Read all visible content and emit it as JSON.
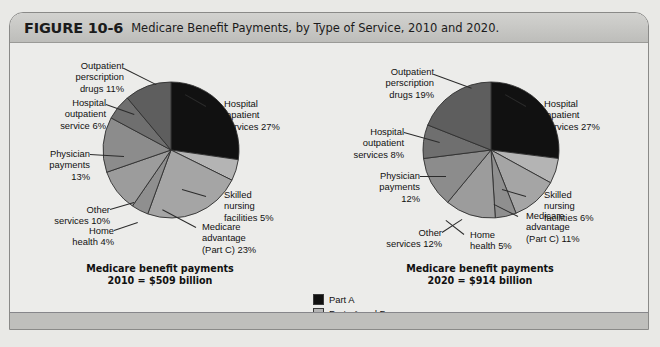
{
  "figure": {
    "number": "FIGURE 10-6",
    "title": "Medicare Benefit Payments, by Type of Service, 2010 and 2020."
  },
  "legend": {
    "items": [
      {
        "label": "Part A",
        "color": "#111111"
      },
      {
        "label": "Parts A and B",
        "color": "#b4b4b4"
      },
      {
        "label": "Part B",
        "color": "#8c8c8c"
      },
      {
        "label": "Part D",
        "color": "#5e5e5e"
      }
    ]
  },
  "chart_data": [
    {
      "type": "pie",
      "title": "Medicare benefit payments\n2010 = $509 billion",
      "year": "2010",
      "total": "$509 billion",
      "categories": [
        "Hospital inpatient services",
        "Skilled nursing facilities",
        "Medicare advantage (Part C)",
        "Home health",
        "Other services",
        "Physician payments",
        "Hospital outpatient service",
        "Outpatient perscription drugs"
      ],
      "values": [
        27,
        5,
        23,
        4,
        10,
        13,
        6,
        11
      ],
      "labels": [
        "Hospital\ninpatient\nservices 27%",
        "Skilled\nnursing\nfacilities 5%",
        "Medicare\nadvantage\n(Part C) 23%",
        "Home\nhealth 4%",
        "Other\nservices 10%",
        "Physician\npayments\n13%",
        "Hospital\noutpatient\nservice 6%",
        "Outpatient\nperscription\ndrugs 11%"
      ],
      "colors": [
        "#111111",
        "#b4b4b4",
        "#a5a5a5",
        "#8f8f8f",
        "#9c9c9c",
        "#8c8c8c",
        "#6f6f6f",
        "#5e5e5e"
      ]
    },
    {
      "type": "pie",
      "title": "Medicare benefit payments\n2020 = $914 billion",
      "year": "2020",
      "total": "$914 billion",
      "categories": [
        "Hospital inpatient services",
        "Skilled nursing facilities",
        "Medicare advantage (Part C)",
        "Home health",
        "Other services",
        "Physician payments",
        "Hospital outpatient services",
        "Outpatient perscription drugs"
      ],
      "values": [
        27,
        6,
        11,
        5,
        12,
        12,
        8,
        19
      ],
      "labels": [
        "Hospital\ninpatient\nservices 27%",
        "Skilled\nnursing\nfacilities 6%",
        "Medicare\nadvantage\n(Part C) 11%",
        "Home\nhealth 5%",
        "Other\nservices 12%",
        "Physician\npayments\n12%",
        "Hospital\noutpatient\nservices 8%",
        "Outpatient\nperscription\ndrugs 19%"
      ],
      "colors": [
        "#111111",
        "#b4b4b4",
        "#a5a5a5",
        "#8f8f8f",
        "#9c9c9c",
        "#8c8c8c",
        "#6f6f6f",
        "#5e5e5e"
      ]
    }
  ]
}
